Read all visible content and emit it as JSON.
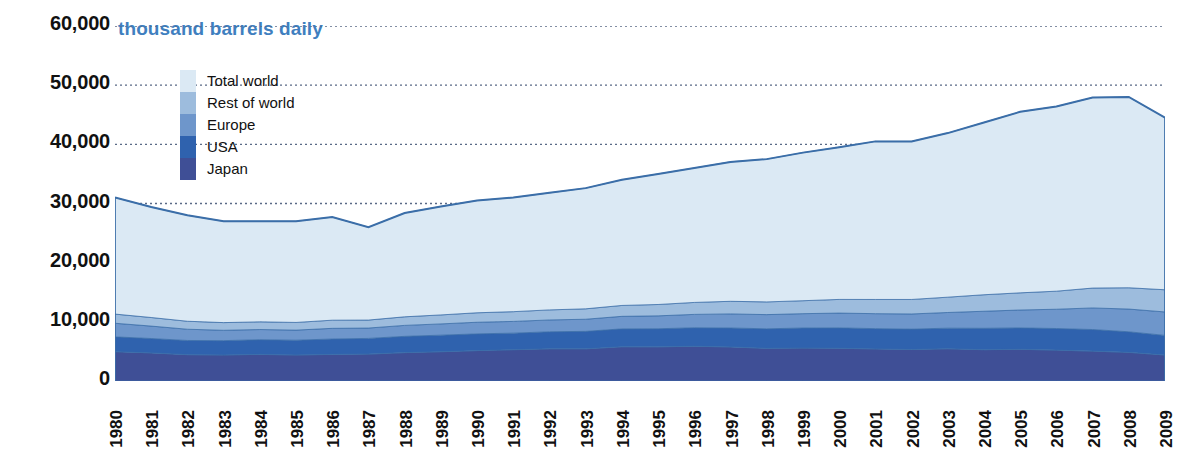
{
  "chart_data": {
    "type": "area",
    "stacked": true,
    "title": "",
    "unit_caption": "thousand barrels daily",
    "xlabel": "",
    "ylabel": "",
    "ylim": [
      0,
      60000
    ],
    "yticks": [
      "0",
      "10,000",
      "20,000",
      "30,000",
      "40,000",
      "50,000",
      "60,000"
    ],
    "ytick_values": [
      0,
      10000,
      20000,
      30000,
      40000,
      50000,
      60000
    ],
    "grid": "horizontal-dotted",
    "legend_position": "upper-left-inside",
    "categories": [
      "1980",
      "1981",
      "1982",
      "1983",
      "1984",
      "1985",
      "1986",
      "1987",
      "1988",
      "1989",
      "1990",
      "1991",
      "1992",
      "1993",
      "1994",
      "1995",
      "1996",
      "1997",
      "1998",
      "1999",
      "2000",
      "2001",
      "2002",
      "2003",
      "2004",
      "2005",
      "2006",
      "2007",
      "2008",
      "2009"
    ],
    "series": [
      {
        "name": "Japan",
        "color": "#3f4f96",
        "values": [
          4960,
          4750,
          4450,
          4400,
          4500,
          4400,
          4500,
          4550,
          4800,
          4950,
          5140,
          5290,
          5440,
          5440,
          5790,
          5780,
          5870,
          5760,
          5520,
          5560,
          5530,
          5420,
          5320,
          5450,
          5290,
          5360,
          5220,
          5050,
          4840,
          4390
        ]
      },
      {
        "name": "USA",
        "color": "#2f62ae",
        "values": [
          2500,
          2430,
          2400,
          2420,
          2480,
          2500,
          2600,
          2650,
          2750,
          2800,
          2830,
          2800,
          2880,
          2950,
          3020,
          3050,
          3130,
          3200,
          3300,
          3400,
          3450,
          3430,
          3450,
          3480,
          3620,
          3620,
          3650,
          3650,
          3480,
          3320
        ]
      },
      {
        "name": "Europe",
        "color": "#6e96cb",
        "values": [
          2300,
          2100,
          1900,
          1750,
          1720,
          1700,
          1800,
          1750,
          1850,
          1900,
          1960,
          1980,
          2000,
          2050,
          2120,
          2180,
          2260,
          2380,
          2400,
          2420,
          2500,
          2530,
          2560,
          2650,
          2880,
          3020,
          3260,
          3650,
          3840,
          3960
        ]
      },
      {
        "name": "Rest of world",
        "color": "#9dbcdd",
        "values": [
          1550,
          1450,
          1350,
          1300,
          1300,
          1300,
          1380,
          1350,
          1450,
          1520,
          1600,
          1650,
          1700,
          1760,
          1840,
          1920,
          2020,
          2130,
          2150,
          2190,
          2310,
          2400,
          2450,
          2590,
          2790,
          2900,
          3050,
          3360,
          3600,
          3750
        ]
      },
      {
        "name": "Total world",
        "color": "#dbe9f4",
        "values": [
          19690,
          18670,
          17900,
          17130,
          17000,
          17100,
          17420,
          15690,
          17550,
          18330,
          18970,
          19280,
          19780,
          20400,
          21230,
          22070,
          22720,
          23580,
          24130,
          25030,
          25710,
          26720,
          26720,
          27730,
          29120,
          30600,
          31220,
          32190,
          32240,
          29080
        ]
      }
    ],
    "totals": [
      31000,
      29400,
      28000,
      27000,
      27000,
      27000,
      27700,
      26000,
      28400,
      29500,
      30500,
      31000,
      31800,
      32600,
      34000,
      35000,
      36000,
      37000,
      37500,
      38600,
      39500,
      40500,
      40500,
      41900,
      43700,
      45500,
      46400,
      47900,
      48000,
      44500
    ],
    "top_line_values": [
      31000,
      29400,
      28000,
      27000,
      27000,
      27000,
      27700,
      26000,
      28400,
      29500,
      30500,
      31000,
      31800,
      32600,
      34000,
      35000,
      36000,
      37000,
      37500,
      38600,
      39500,
      40500,
      40500,
      41900,
      43700,
      45500,
      46400,
      47900,
      48000,
      44500
    ],
    "colors": {
      "caption": "#3f7fbf",
      "total_world": "#dbe9f4",
      "rest_of_world": "#9dbcdd",
      "europe": "#6e96cb",
      "usa": "#2f62ae",
      "japan": "#3f4f96",
      "line": "#3b6ea8",
      "grid": "#5a6a86",
      "text": "#111111"
    }
  },
  "legend": {
    "items": [
      {
        "label": "Total world",
        "color": "#dbe9f4"
      },
      {
        "label": "Rest of world",
        "color": "#9dbcdd"
      },
      {
        "label": "Europe",
        "color": "#6e96cb"
      },
      {
        "label": "USA",
        "color": "#2f62ae"
      },
      {
        "label": "Japan",
        "color": "#3f4f96"
      }
    ]
  }
}
